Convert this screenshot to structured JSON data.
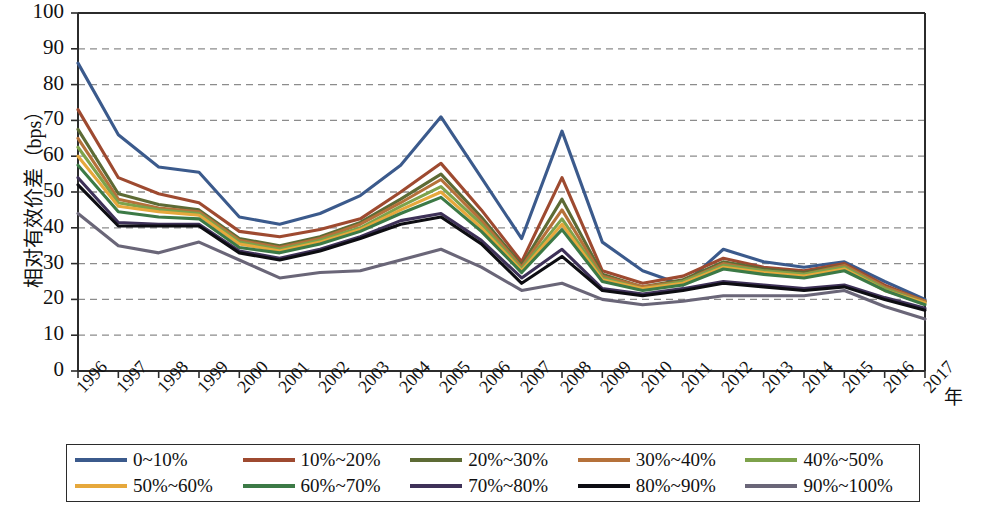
{
  "chart_data": {
    "type": "line",
    "title": "",
    "xlabel": "年",
    "ylabel": "相对有效价差（bps）",
    "ylim": [
      0,
      100
    ],
    "ytick_values": [
      0,
      10,
      20,
      30,
      40,
      50,
      60,
      70,
      80,
      90,
      100
    ],
    "grid": true,
    "grid_style": "dashed-horizontal",
    "legend_position": "bottom",
    "legend_columns": 5,
    "x": [
      "1996",
      "1997",
      "1998",
      "1999",
      "2000",
      "2001",
      "2002",
      "2003",
      "2004",
      "2005",
      "2006",
      "2007",
      "2008",
      "2009",
      "2010",
      "2011",
      "2012",
      "2013",
      "2014",
      "2015",
      "2016",
      "2017"
    ],
    "categories": [
      "1996",
      "1997",
      "1998",
      "1999",
      "2000",
      "2001",
      "2002",
      "2003",
      "2004",
      "2005",
      "2006",
      "2007",
      "2008",
      "2009",
      "2010",
      "2011",
      "2012",
      "2013",
      "2014",
      "2015",
      "2016",
      "2017"
    ],
    "series": [
      {
        "name": "0~10%",
        "color": "#3b5a8c",
        "values": [
          86,
          66,
          57,
          55.5,
          43,
          41,
          44,
          49,
          57.5,
          71,
          54,
          37,
          67,
          36,
          28,
          24,
          34,
          30.5,
          29,
          30.5,
          25,
          20
        ]
      },
      {
        "name": "10%~20%",
        "color": "#9e4a30",
        "values": [
          73,
          54,
          49.5,
          47,
          39,
          37.5,
          39.5,
          42.5,
          50,
          58,
          45,
          30.5,
          54,
          28,
          24.5,
          26.5,
          31.5,
          29,
          28,
          30,
          24,
          19.5
        ]
      },
      {
        "name": "20%~30%",
        "color": "#5d6b35",
        "values": [
          67.5,
          49.5,
          46.5,
          45,
          37,
          35,
          37.5,
          41.5,
          48,
          55,
          43,
          29.5,
          48,
          27,
          23.5,
          25.5,
          30.5,
          28.5,
          27.5,
          29.5,
          23.5,
          19.5
        ]
      },
      {
        "name": "30%~40%",
        "color": "#b5713a",
        "values": [
          65,
          48,
          45.5,
          44.5,
          36.5,
          34.5,
          37,
          41,
          47,
          53.5,
          42,
          29,
          45,
          26.5,
          23.5,
          25,
          30,
          28,
          27,
          29.5,
          23.5,
          19.5
        ]
      },
      {
        "name": "40%~50%",
        "color": "#7da24b",
        "values": [
          62.5,
          47,
          45,
          44,
          36,
          34,
          36.5,
          40,
          46,
          51.5,
          41,
          28.5,
          42.5,
          26,
          23,
          25,
          29.5,
          28,
          27,
          29,
          23,
          19
        ]
      },
      {
        "name": "50%~60%",
        "color": "#e6a83c",
        "values": [
          60,
          46,
          44.5,
          43.5,
          35.5,
          33.5,
          36,
          39.5,
          45,
          50,
          40,
          28,
          41,
          25.5,
          23,
          24.5,
          29,
          27.5,
          26.5,
          28.5,
          22.5,
          19
        ]
      },
      {
        "name": "60%~70%",
        "color": "#3c7a46",
        "values": [
          57.5,
          44.5,
          43,
          42.5,
          34.5,
          33,
          35.5,
          39,
          44,
          48.5,
          39,
          27.5,
          39.5,
          25,
          22.5,
          24,
          28.5,
          27,
          26,
          28,
          22.5,
          18.5
        ]
      },
      {
        "name": "70%~80%",
        "color": "#3e3158",
        "values": [
          54,
          41.5,
          41,
          41,
          33.5,
          31.5,
          34,
          37.5,
          42,
          44,
          36.5,
          26,
          34,
          23,
          21.5,
          23,
          25,
          24,
          23,
          24,
          20.5,
          17.5
        ]
      },
      {
        "name": "80%~90%",
        "color": "#0d0d12",
        "values": [
          52,
          40.5,
          40.5,
          40.5,
          33,
          31,
          33.5,
          37,
          41,
          43,
          35.5,
          24.5,
          32,
          22.5,
          21,
          22.5,
          24.5,
          23.5,
          22.5,
          23.5,
          20,
          17
        ]
      },
      {
        "name": "90%~100%",
        "color": "#6a6678",
        "values": [
          44,
          35,
          33,
          36,
          31,
          26,
          27.5,
          28,
          31,
          34,
          29,
          22.5,
          24.5,
          20,
          18.5,
          19.5,
          21,
          21,
          21,
          22.5,
          18,
          14.5
        ]
      }
    ]
  },
  "axes": {
    "y_title": "相对有效价差（bps）",
    "x_title": "年",
    "y_ticks": [
      "100",
      "90",
      "80",
      "70",
      "60",
      "50",
      "40",
      "30",
      "20",
      "10",
      "0"
    ],
    "x_ticks": [
      "1996",
      "1997",
      "1998",
      "1999",
      "2000",
      "2001",
      "2002",
      "2003",
      "2004",
      "2005",
      "2006",
      "2007",
      "2008",
      "2009",
      "2010",
      "2011",
      "2012",
      "2013",
      "2014",
      "2015",
      "2016",
      "2017"
    ]
  },
  "legend": {
    "items": [
      {
        "label": "0~10%",
        "color": "#3b5a8c"
      },
      {
        "label": "10%~20%",
        "color": "#9e4a30"
      },
      {
        "label": "20%~30%",
        "color": "#5d6b35"
      },
      {
        "label": "30%~40%",
        "color": "#b5713a"
      },
      {
        "label": "40%~50%",
        "color": "#7da24b"
      },
      {
        "label": "50%~60%",
        "color": "#e6a83c"
      },
      {
        "label": "60%~70%",
        "color": "#3c7a46"
      },
      {
        "label": "70%~80%",
        "color": "#3e3158"
      },
      {
        "label": "80%~90%",
        "color": "#0d0d12"
      },
      {
        "label": "90%~100%",
        "color": "#6a6678"
      }
    ]
  }
}
